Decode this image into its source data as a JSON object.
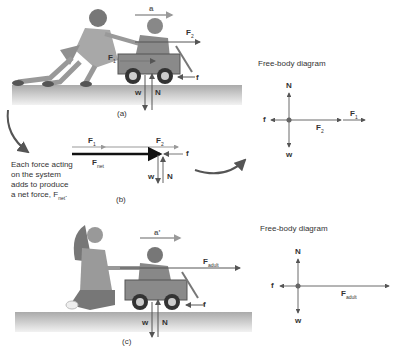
{
  "panel_a": {
    "caption": "(a)",
    "accel_label": "a",
    "forces": {
      "F1": "F",
      "F1_sub": "1",
      "F2": "F",
      "F2_sub": "2",
      "f": "f",
      "w": "w",
      "N": "N"
    },
    "fbd": {
      "title": "Free-body diagram",
      "labels": {
        "N": "N",
        "f": "f",
        "w": "w",
        "F1": "F",
        "F1_sub": "1",
        "F2": "F",
        "F2_sub": "2"
      }
    }
  },
  "panel_b": {
    "caption": "(b)",
    "labels": {
      "F1": "F",
      "F1_sub": "1",
      "F2": "F",
      "F2_sub": "2",
      "Fnet": "F",
      "Fnet_sub": "net",
      "f": "f",
      "w": "w",
      "N": "N"
    },
    "note_lines": [
      "Each force acting",
      "on the system",
      "adds to produce"
    ],
    "note_last": "a net force, F",
    "note_last_sub": "net",
    "note_end": "."
  },
  "panel_c": {
    "caption": "(c)",
    "accel_label": "a'",
    "forces": {
      "Fadult": "F",
      "Fadult_sub": "adult",
      "f": "f",
      "w": "w",
      "N": "N"
    },
    "fbd": {
      "title": "Free-body diagram",
      "labels": {
        "N": "N",
        "f": "f",
        "w": "w",
        "Fadult": "F",
        "Fadult_sub": "adult"
      }
    }
  },
  "colors": {
    "ground": "#b8b8b8",
    "arrow": "#555555",
    "wagon": "#8a8a8a",
    "figure": "#9a9a9a"
  }
}
